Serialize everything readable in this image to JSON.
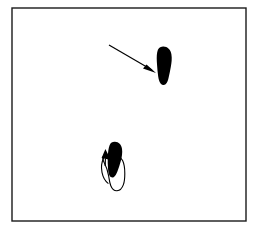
{
  "figure": {
    "title": "Footprint impression diagram",
    "background_color": "#ffffff",
    "ink_color": "#000000",
    "frame": {
      "name": "Border frame",
      "x": 12,
      "y": 8,
      "width": 234,
      "height": 213,
      "stroke_color": "#1a1a1a",
      "stroke_width": 1.4
    },
    "elements": {
      "upper_print": {
        "label": "Upper solid footprint impression",
        "fill": "#000000",
        "center_x": 163,
        "center_y": 66
      },
      "upper_arrow": {
        "label": "Pointer arrow to upper footprint",
        "stroke": "#000000",
        "stroke_width": 1.2,
        "start_x": 109,
        "start_y": 45,
        "end_x": 155,
        "end_y": 72
      },
      "lower_print_solid": {
        "label": "Lower solid footprint impression",
        "fill": "#000000",
        "center_x": 114,
        "center_y": 159
      },
      "lower_print_outline": {
        "label": "Lower outlined footprint impression",
        "fill": "#ffffff",
        "stroke": "#000000",
        "stroke_width": 1.1,
        "center_x": 113,
        "center_y": 174
      },
      "lower_arrow": {
        "label": "Small upward pointer arrowhead",
        "fill": "#000000",
        "tip_x": 106,
        "tip_y": 150
      }
    }
  }
}
